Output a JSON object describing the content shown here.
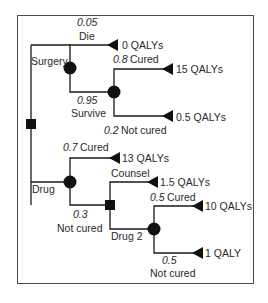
{
  "diagram": {
    "type": "decision-tree",
    "colors": {
      "line": "#1a1a1a",
      "node": "#111111",
      "frame": "#4a4a4a",
      "text": "#2a2a2a"
    },
    "root": {
      "kind": "decision",
      "shape": "square"
    },
    "branches": {
      "surgery": {
        "label": "Surgery",
        "die": {
          "prob": "0.05",
          "label": "Die",
          "outcome": "0 QALYs"
        },
        "survive": {
          "prob": "0.95",
          "label": "Survive",
          "cured": {
            "prob": "0.8",
            "label": "Cured",
            "outcome": "15 QALYs"
          },
          "not_cured": {
            "prob": "0.2",
            "label": "Not cured",
            "outcome": "0.5 QALYs"
          }
        }
      },
      "drug": {
        "label": "Drug",
        "cured": {
          "prob": "0.7",
          "label": "Cured",
          "outcome": "13 QALYs"
        },
        "not_cured": {
          "prob": "0.3",
          "label": "Not cured",
          "counsel": {
            "label": "Counsel",
            "outcome": "1.5 QALYs"
          },
          "drug2": {
            "label": "Drug 2",
            "cured": {
              "prob": "0.5",
              "label": "Cured",
              "outcome": "10 QALYs"
            },
            "not_cured": {
              "prob": "0.5",
              "label": "Not cured",
              "outcome": "1 QALY"
            }
          }
        }
      }
    }
  }
}
